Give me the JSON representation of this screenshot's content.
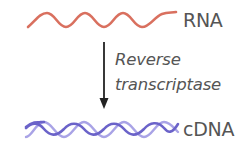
{
  "diagram": {
    "rna": {
      "label": "RNA",
      "color": "#d9705f"
    },
    "process": {
      "line1": "Reverse",
      "line2": "transcriptase",
      "arrow_color": "#222222"
    },
    "cdna": {
      "label": "cDNA",
      "strand_dark": "#6b63c9",
      "strand_light": "#a9a3e6"
    }
  }
}
